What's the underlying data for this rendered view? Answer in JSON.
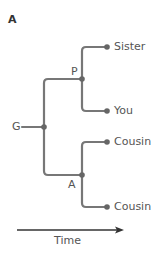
{
  "panel": {
    "letter": "A"
  },
  "tree": {
    "nodes": {
      "grandparent": {
        "label": "G"
      },
      "parent": {
        "label": "P"
      },
      "aunt_uncle": {
        "label": "A"
      }
    },
    "leaves": [
      {
        "label": "Sister"
      },
      {
        "label": "You"
      },
      {
        "label": "Cousin"
      },
      {
        "label": "Cousin"
      }
    ]
  },
  "axis": {
    "label": "Time"
  },
  "colors": {
    "branch": "#777777",
    "node": "#666666",
    "arrow": "#333333",
    "text": "#555555"
  }
}
